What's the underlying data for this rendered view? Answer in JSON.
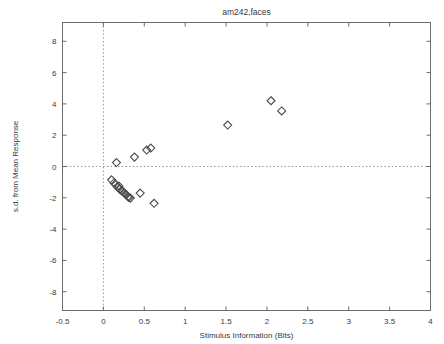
{
  "chart_data": {
    "type": "scatter",
    "title": "am242,faces",
    "xlabel": "Stimulus Information (Bits)",
    "ylabel": "s.d. from Mean Response",
    "xlim": [
      -0.5,
      4
    ],
    "ylim": [
      -9.2,
      9.2
    ],
    "xticks": [
      -0.5,
      0,
      0.5,
      1,
      1.5,
      2,
      2.5,
      3,
      3.5,
      4
    ],
    "xticklabels": [
      "-0.5",
      "0",
      "0.5",
      "1",
      "1.5",
      "2",
      "2.5",
      "3",
      "3.5",
      "4"
    ],
    "yticks": [
      -8,
      -6,
      -4,
      -2,
      0,
      2,
      4,
      6,
      8
    ],
    "yticklabels": [
      "-8",
      "-6",
      "-4",
      "-2",
      "0",
      "2",
      "4",
      "6",
      "8"
    ],
    "grid": false,
    "legend": null,
    "reference_lines": [
      {
        "axis": "x",
        "value": 0,
        "style": "dotted"
      },
      {
        "axis": "y",
        "value": 0,
        "style": "dotted"
      }
    ],
    "marker": {
      "shape": "diamond",
      "filled": false,
      "color": "#4a4a4a",
      "size": 4
    },
    "series": [
      {
        "name": "faces",
        "points": [
          [
            0.1,
            -0.85
          ],
          [
            0.13,
            -1.05
          ],
          [
            0.15,
            -1.15
          ],
          [
            0.17,
            -1.3
          ],
          [
            0.19,
            -1.25
          ],
          [
            0.2,
            -1.45
          ],
          [
            0.22,
            -1.55
          ],
          [
            0.24,
            -1.6
          ],
          [
            0.26,
            -1.72
          ],
          [
            0.28,
            -1.8
          ],
          [
            0.3,
            -1.92
          ],
          [
            0.31,
            -1.98
          ],
          [
            0.33,
            -2.02
          ],
          [
            0.16,
            0.25
          ],
          [
            0.38,
            0.6
          ],
          [
            0.53,
            1.05
          ],
          [
            0.58,
            1.18
          ],
          [
            0.45,
            -1.7
          ],
          [
            0.62,
            -2.35
          ],
          [
            1.52,
            2.65
          ],
          [
            2.05,
            4.2
          ],
          [
            2.18,
            3.55
          ]
        ]
      }
    ]
  }
}
